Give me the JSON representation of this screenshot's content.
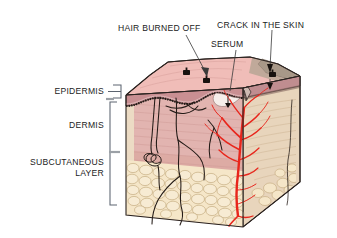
{
  "figure": {
    "callouts": [
      {
        "id": "hair-burned-off",
        "label": "HAIR BURNED OFF"
      },
      {
        "id": "crack-in-the-skin",
        "label": "CRACK IN THE SKIN"
      },
      {
        "id": "serum",
        "label": "SERUM"
      }
    ],
    "layer_labels": [
      {
        "id": "epidermis",
        "label": "EPIDERMIS",
        "lines": [
          "EPIDERMIS"
        ]
      },
      {
        "id": "dermis",
        "label": "DERMIS",
        "lines": [
          "DERMIS"
        ]
      },
      {
        "id": "subcutaneous-layer",
        "label": "SUBCUTANEOUS LAYER",
        "lines": [
          "SUBCUTANEOUS",
          "LAYER"
        ]
      }
    ],
    "colors": {
      "surface_pink": "#f0bdb8",
      "surface_burned": "#a89888",
      "epidermis_band": "#c98f92",
      "dermis": "#e2b4b0",
      "dermis_deep": "#dda9a2",
      "subcutaneous_fat": "#f5e6c8",
      "side_face_tan": "#e8d5bc",
      "blood_vessel_red": "#e8261c",
      "outline_dark": "#2b2320",
      "serum_white": "#f6eeea",
      "bracket_gray": "#5c6470",
      "tick_gray": "#9ba0a6",
      "text_black": "#1b1b1b",
      "background": "#ffffff"
    }
  }
}
